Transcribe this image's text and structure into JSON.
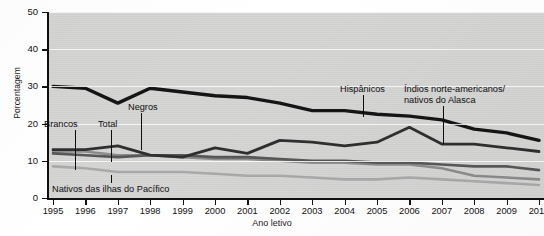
{
  "chart_data": {
    "type": "line",
    "title": "",
    "xlabel": "Ano letivo",
    "ylabel": "Porcentagem",
    "categories": [
      "1995",
      "1996",
      "1997",
      "1998",
      "1999",
      "2000",
      "2001",
      "2002",
      "2003",
      "2004",
      "2005",
      "2006",
      "2007",
      "2008",
      "2009",
      "2010"
    ],
    "x_tick_labels": [
      "1995",
      "1996",
      "1997",
      "1998",
      "1999",
      "2000",
      "2001",
      "2002",
      "2003",
      "2004",
      "2005",
      "2006",
      "2007",
      "2008",
      "2009",
      "2010"
    ],
    "y_tick_labels": [
      "0",
      "10",
      "20",
      "30",
      "40",
      "50"
    ],
    "y_ticks": [
      0,
      10,
      20,
      30,
      40,
      50
    ],
    "ylim": [
      0,
      50
    ],
    "xlim": [
      "1995",
      "2010"
    ],
    "grid": true,
    "grid_orientation": "horizontal",
    "legend": "inline-labels-with-leader-lines",
    "plot_background": "#d5d5d4",
    "series": [
      {
        "name": "Hispânicos",
        "color": "#111111",
        "width": 3.4,
        "values": [
          30,
          29.5,
          25.5,
          29.5,
          28.5,
          27.5,
          27,
          25.5,
          23.5,
          23.5,
          22.5,
          22,
          21,
          18.5,
          17.5,
          15.5
        ]
      },
      {
        "name": "Índios norte-americanos/nativos do Alasca",
        "color": "#2c2c2c",
        "width": 2.8,
        "values": [
          13,
          13,
          14,
          11.5,
          11,
          13.5,
          12,
          15.5,
          15,
          14,
          15,
          19,
          14.5,
          14.5,
          13.5,
          12.5
        ]
      },
      {
        "name": "Total",
        "color": "#555555",
        "width": 2.6,
        "values": [
          12,
          11.5,
          11,
          11.5,
          11.5,
          11,
          11,
          10.5,
          10,
          10,
          9.5,
          9.5,
          9,
          8.5,
          8.5,
          7.5
        ]
      },
      {
        "name": "Brancos",
        "color": "#8b8b8b",
        "width": 2.6,
        "values": [
          12.5,
          12.5,
          11.5,
          11.5,
          11,
          10.5,
          10.5,
          10,
          9.5,
          9.5,
          9,
          9,
          8,
          6,
          5.5,
          5
        ]
      },
      {
        "name": "Nativos das ilhas do Pacífico",
        "color": "#a9a9a9",
        "width": 2.6,
        "values": [
          8.5,
          8,
          7,
          7,
          7,
          6.5,
          6,
          6,
          5.5,
          5,
          5,
          5.5,
          5,
          4.5,
          4,
          3.5
        ]
      }
    ],
    "annotations": [
      {
        "label": "Brancos",
        "points_to_series": "Brancos"
      },
      {
        "label": "Total",
        "points_to_series": "Total"
      },
      {
        "label": "Negros",
        "points_to_series": "Índios norte-americanos/nativos do Alasca"
      },
      {
        "label": "Nativos das ilhas do Pacífico",
        "points_to_series": "Nativos das ilhas do Pacífico"
      },
      {
        "label": "Hispânicos",
        "points_to_series": "Hispânicos"
      },
      {
        "label": "Índios norte-americanos/nativos do Alasca",
        "points_to_series": "Índios norte-americanos/nativos do Alasca"
      }
    ]
  },
  "annotations": {
    "brancos": "Brancos",
    "total": "Total",
    "negros": "Negros",
    "nativos_pacifico": "Nativos das ilhas do Pacífico",
    "hispanicos": "Hispânicos",
    "indios_line1": "Índios norte-americanos/",
    "indios_line2": "nativos do Alasca"
  }
}
